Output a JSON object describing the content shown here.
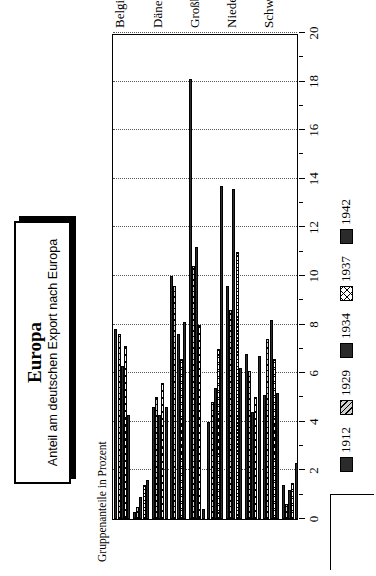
{
  "title_block": {
    "title": "Europa",
    "subtitle": "Anteil am deutschen Export nach Europa"
  },
  "axis": {
    "ylabel": "Gruppenanteile in Prozent",
    "tick_labels": [
      "0",
      "2",
      "4",
      "6",
      "8",
      "10",
      "12",
      "14",
      "16",
      "18",
      "20"
    ]
  },
  "legend": {
    "items": [
      {
        "label": "1912",
        "pattern": "solid-dark"
      },
      {
        "label": "1929",
        "pattern": "diagonal-hatch"
      },
      {
        "label": "1934",
        "pattern": "solid-dark"
      },
      {
        "label": "1937",
        "pattern": "cross-hatch"
      },
      {
        "label": "1942",
        "pattern": "solid-dark"
      }
    ]
  },
  "chart_data": {
    "type": "bar",
    "orientation": "horizontal",
    "title": "Europa",
    "subtitle": "Anteil am deutschen Export nach Europa",
    "xlabel": "",
    "ylabel": "Gruppenanteile in Prozent",
    "ylim": [
      0,
      20
    ],
    "grid": true,
    "legend_position": "bottom-left",
    "categories": [
      "Belgien",
      "Bulgarien",
      "Dänemark",
      "Frankreich",
      "Großbritannien",
      "Italien",
      "Niederlande",
      "Schweden",
      "Schweiz",
      "Sowjetunion"
    ],
    "series": [
      {
        "name": "1912",
        "values": [
          7.8,
          0.3,
          4.6,
          10.0,
          18.1,
          4.0,
          9.6,
          6.8,
          5.1,
          1.4
        ]
      },
      {
        "name": "1929",
        "values": [
          7.6,
          0.5,
          5.0,
          9.6,
          10.4,
          4.8,
          8.6,
          6.1,
          7.4,
          0.6
        ]
      },
      {
        "name": "1934",
        "values": [
          6.3,
          0.9,
          4.3,
          7.6,
          11.2,
          5.4,
          13.6,
          4.4,
          8.2,
          1.2
        ]
      },
      {
        "name": "1937",
        "values": [
          7.1,
          1.4,
          5.6,
          6.6,
          8.0,
          7.0,
          11.0,
          5.0,
          6.6,
          1.5
        ]
      },
      {
        "name": "1942",
        "values": [
          4.3,
          1.6,
          4.6,
          8.1,
          0.4,
          13.7,
          6.2,
          6.7,
          5.2,
          2.3
        ]
      }
    ]
  }
}
